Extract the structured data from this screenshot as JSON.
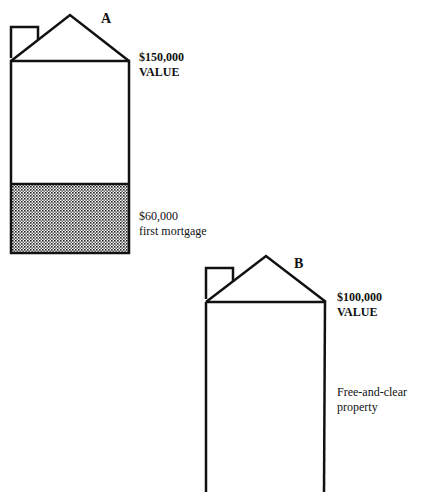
{
  "house_a": {
    "label": "A",
    "value": "$150,000",
    "value_caption": "VALUE",
    "mortgage_amount": "$60,000",
    "mortgage_caption": "first mortgage"
  },
  "house_b": {
    "label": "B",
    "value": "$100,000",
    "value_caption": "VALUE",
    "status": "Free-and-clear",
    "status_caption": "property"
  }
}
